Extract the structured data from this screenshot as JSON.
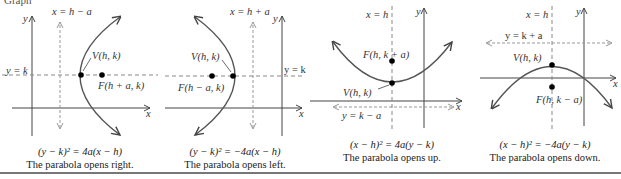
{
  "header_fragment": "Graph",
  "panels": [
    {
      "id": "opens-right",
      "directrix_label": "x = h − a",
      "axis_label": "y = k",
      "vertex_label": "V(h, k)",
      "focus_label": "F(h + a, k)",
      "x_axis_label": "x",
      "y_axis_label": "y",
      "equation": "(y − k)² = 4a(x − h)",
      "caption": "The parabola opens right."
    },
    {
      "id": "opens-left",
      "directrix_label": "x = h + a",
      "axis_label": "y = k",
      "vertex_label": "V(h, k)",
      "focus_label": "F(h − a, k)",
      "x_axis_label": "x",
      "y_axis_label": "y",
      "equation": "(y − k)² = −4a(x − h)",
      "caption": "The parabola opens left."
    },
    {
      "id": "opens-up",
      "directrix_label": "y = k − a",
      "axis_label": "x = h",
      "vertex_label": "V(h, k)",
      "focus_label": "F(h, k + a)",
      "x_axis_label": "x",
      "y_axis_label": "y",
      "equation": "(x − h)² = 4a(y − k)",
      "caption": "The parabola opens up."
    },
    {
      "id": "opens-down",
      "directrix_label": "y = k + a",
      "axis_label": "x = h",
      "vertex_label": "V(h, k)",
      "focus_label": "F(h, k − a)",
      "x_axis_label": "x",
      "y_axis_label": "y",
      "equation": "(x − h)² = −4a(y − k)",
      "caption": "The parabola opens down."
    }
  ],
  "colors": {
    "curve": "#555555",
    "dashed": "#888888",
    "axis": "#444444",
    "point": "#000000"
  }
}
